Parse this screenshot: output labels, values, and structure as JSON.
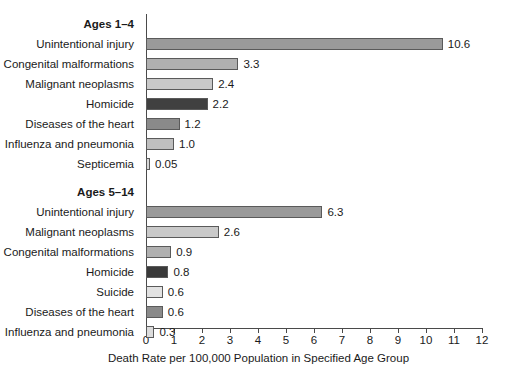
{
  "chart_data": {
    "type": "bar",
    "orientation": "horizontal",
    "title": "",
    "xlabel": "Death Rate per 100,000 Population in Specified Age Group",
    "ylabel": "",
    "xlim": [
      0,
      12
    ],
    "xticks": [
      "0",
      "1",
      "2",
      "3",
      "4",
      "5",
      "6",
      "7",
      "8",
      "9",
      "10",
      "11",
      "12"
    ],
    "grid": false,
    "legend": "none",
    "groups": [
      {
        "name": "Ages 1–4",
        "categories": [
          "Unintentional injury",
          "Congenital malformations",
          "Malignant neoplasms",
          "Homicide",
          "Diseases of the heart",
          "Influenza and pneumonia",
          "Septicemia"
        ],
        "values": [
          10.6,
          3.3,
          2.4,
          2.2,
          1.2,
          1.0,
          0.05
        ],
        "value_labels": [
          "10.6",
          "3.3",
          "2.4",
          "2.2",
          "1.2",
          "1.0",
          "0.05"
        ],
        "colors": [
          "#9a9a9a",
          "#b0b0b0",
          "#c9c9c9",
          "#404040",
          "#8a8a8a",
          "#bfbfbf",
          "#d8d8d8"
        ]
      },
      {
        "name": "Ages 5–14",
        "categories": [
          "Unintentional injury",
          "Malignant neoplasms",
          "Congenital malformations",
          "Homicide",
          "Suicide",
          "Diseases of the heart",
          "Influenza and pneumonia"
        ],
        "values": [
          6.3,
          2.6,
          0.9,
          0.8,
          0.6,
          0.6,
          0.3
        ],
        "value_labels": [
          "6.3",
          "2.6",
          "0.9",
          "0.8",
          "0.6",
          "0.6",
          "0.3"
        ],
        "colors": [
          "#9a9a9a",
          "#c9c9c9",
          "#b0b0b0",
          "#3a3a3a",
          "#e2e2e2",
          "#8a8a8a",
          "#dcdcdc"
        ]
      }
    ]
  }
}
